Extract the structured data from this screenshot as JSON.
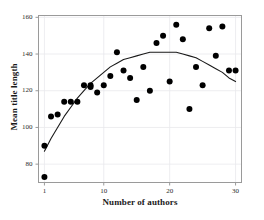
{
  "chart_data": {
    "type": "scatter",
    "title": "",
    "xlabel": "Number of authors",
    "ylabel": "Mean title length",
    "xlim": [
      0.1,
      30.9
    ],
    "ylim": [
      70,
      161
    ],
    "xticks": [
      1,
      10,
      20,
      30
    ],
    "xtick_labels": [
      "1",
      "10",
      "20",
      "30"
    ],
    "yticks": [
      80,
      100,
      120,
      140,
      160
    ],
    "ytick_labels": [
      "80",
      "100",
      "120",
      "140",
      "160"
    ],
    "grid": true,
    "grid_color": "#e8e8ec",
    "legend": "none",
    "marker_color": "#000000",
    "marker_size": 3.0,
    "frame_color": "#9a9a9a",
    "points": [
      {
        "x": 1,
        "y": 73
      },
      {
        "x": 1,
        "y": 90
      },
      {
        "x": 2,
        "y": 106
      },
      {
        "x": 3,
        "y": 107
      },
      {
        "x": 4,
        "y": 114
      },
      {
        "x": 5,
        "y": 114
      },
      {
        "x": 6,
        "y": 114
      },
      {
        "x": 7,
        "y": 123
      },
      {
        "x": 8,
        "y": 123
      },
      {
        "x": 8,
        "y": 122
      },
      {
        "x": 9,
        "y": 119
      },
      {
        "x": 10,
        "y": 123
      },
      {
        "x": 11,
        "y": 128
      },
      {
        "x": 12,
        "y": 141
      },
      {
        "x": 13,
        "y": 131
      },
      {
        "x": 14,
        "y": 127
      },
      {
        "x": 15,
        "y": 115
      },
      {
        "x": 16,
        "y": 133
      },
      {
        "x": 17,
        "y": 120
      },
      {
        "x": 18,
        "y": 146
      },
      {
        "x": 19,
        "y": 150
      },
      {
        "x": 20,
        "y": 125
      },
      {
        "x": 21,
        "y": 156
      },
      {
        "x": 22,
        "y": 148
      },
      {
        "x": 23,
        "y": 110
      },
      {
        "x": 24,
        "y": 133
      },
      {
        "x": 25,
        "y": 123
      },
      {
        "x": 26,
        "y": 154
      },
      {
        "x": 27,
        "y": 139
      },
      {
        "x": 28,
        "y": 155
      },
      {
        "x": 29,
        "y": 131
      },
      {
        "x": 30,
        "y": 131
      }
    ],
    "fit_curve": {
      "name": "quadratic-fit",
      "color": "#1a1a1a",
      "points": [
        {
          "x": 1,
          "y": 87
        },
        {
          "x": 2,
          "y": 94
        },
        {
          "x": 3,
          "y": 100
        },
        {
          "x": 4,
          "y": 106
        },
        {
          "x": 5,
          "y": 111
        },
        {
          "x": 6,
          "y": 116
        },
        {
          "x": 7,
          "y": 120
        },
        {
          "x": 8,
          "y": 124
        },
        {
          "x": 9,
          "y": 127
        },
        {
          "x": 10,
          "y": 130
        },
        {
          "x": 11,
          "y": 133
        },
        {
          "x": 12,
          "y": 135
        },
        {
          "x": 13,
          "y": 137
        },
        {
          "x": 14,
          "y": 138
        },
        {
          "x": 15,
          "y": 139
        },
        {
          "x": 16,
          "y": 140
        },
        {
          "x": 17,
          "y": 141
        },
        {
          "x": 18,
          "y": 141
        },
        {
          "x": 19,
          "y": 141
        },
        {
          "x": 20,
          "y": 141
        },
        {
          "x": 21,
          "y": 141
        },
        {
          "x": 22,
          "y": 140
        },
        {
          "x": 23,
          "y": 139
        },
        {
          "x": 24,
          "y": 138
        },
        {
          "x": 25,
          "y": 136
        },
        {
          "x": 26,
          "y": 134
        },
        {
          "x": 27,
          "y": 132
        },
        {
          "x": 28,
          "y": 130
        },
        {
          "x": 29,
          "y": 127
        },
        {
          "x": 30,
          "y": 125
        }
      ]
    }
  }
}
